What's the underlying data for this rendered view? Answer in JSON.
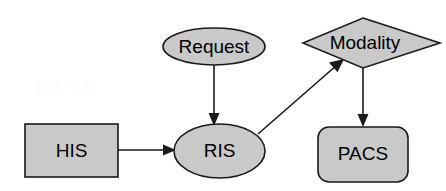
{
  "diagram": {
    "background_color": "#ffffff",
    "node_fill_color": "#c9c9c9",
    "node_stroke_color": "#1a1a1a",
    "label_color": "#000000",
    "nodes": [
      {
        "id": "his",
        "label": "HIS",
        "shape": "rectangle"
      },
      {
        "id": "request",
        "label": "Request",
        "shape": "ellipse"
      },
      {
        "id": "ris",
        "label": "RIS",
        "shape": "ellipse"
      },
      {
        "id": "modality",
        "label": "Modality",
        "shape": "diamond"
      },
      {
        "id": "pacs",
        "label": "PACS",
        "shape": "rounded-rectangle"
      }
    ],
    "edges": [
      {
        "id": "his-to-ris",
        "from": "HIS",
        "to": "RIS",
        "direction": "right",
        "label": ""
      },
      {
        "id": "request-to-ris",
        "from": "Request",
        "to": "RIS",
        "direction": "down",
        "label": ""
      },
      {
        "id": "ris-to-modality",
        "from": "RIS",
        "to": "Modality",
        "direction": "up-right",
        "label": ""
      },
      {
        "id": "modality-to-pacs",
        "from": "Modality",
        "to": "PACS",
        "direction": "down",
        "label": ""
      }
    ],
    "watermark": "ᴇᴏ ѕᴄ"
  }
}
